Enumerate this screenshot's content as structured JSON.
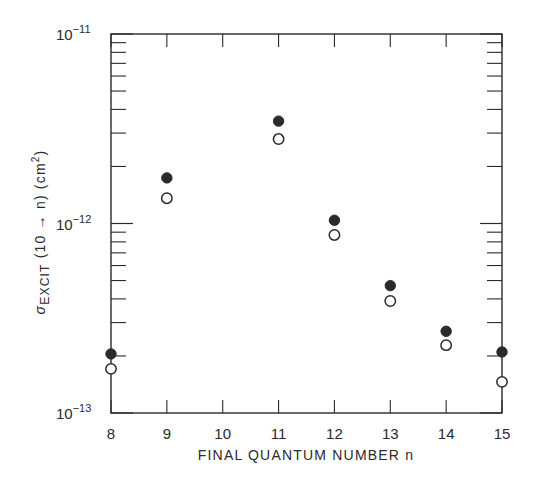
{
  "chart_data": {
    "type": "scatter",
    "title": "",
    "xlabel": "FINAL QUANTUM NUMBER n",
    "ylabel": {
      "symbol": "σ",
      "subscript": "EXCIT",
      "transition": "(10 → n)",
      "unit": "(cm",
      "unit_sup": "2",
      "unit_close": ")"
    },
    "x_ticks": [
      8,
      9,
      10,
      11,
      12,
      13,
      14,
      15
    ],
    "xlim": [
      8,
      15
    ],
    "yscale": "log",
    "ylim": [
      1e-13,
      1e-11
    ],
    "y_ticks": [
      {
        "value": 1e-13,
        "base": "10",
        "exp": "−13"
      },
      {
        "value": 1e-12,
        "base": "10",
        "exp": "−12"
      },
      {
        "value": 1e-11,
        "base": "10",
        "exp": "−11"
      }
    ],
    "grid": false,
    "legend": null,
    "series": [
      {
        "name": "filled circles",
        "marker": "filled-circle",
        "x": [
          8,
          9,
          11,
          12,
          13,
          14,
          15
        ],
        "values": [
          2.05e-13,
          1.74e-12,
          3.47e-12,
          1.04e-12,
          4.7e-13,
          2.7e-13,
          2.1e-13
        ]
      },
      {
        "name": "open circles",
        "marker": "open-circle",
        "x": [
          8,
          9,
          11,
          12,
          13,
          14,
          15
        ],
        "values": [
          1.71e-13,
          1.36e-12,
          2.79e-12,
          8.7e-13,
          3.9e-13,
          2.28e-13,
          1.46e-13
        ]
      }
    ]
  },
  "colors": {
    "ink": "#2a2a2a",
    "background": "#ffffff"
  }
}
